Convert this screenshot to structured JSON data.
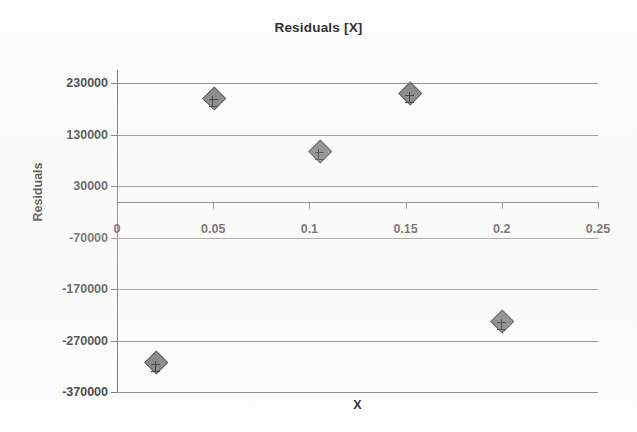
{
  "chart_data": {
    "type": "scatter",
    "title": "Residuals [X]",
    "xlabel": "X",
    "ylabel": "Residuals",
    "xlim": [
      0,
      0.25
    ],
    "ylim": [
      -370000,
      230000
    ],
    "grid": true,
    "legend": "none",
    "x_ticks": [
      "0",
      "0.05",
      "0.1",
      "0.15",
      "0.2",
      "0.25"
    ],
    "x_tick_values": [
      0,
      0.05,
      0.1,
      0.15,
      0.2,
      0.25
    ],
    "y_ticks": [
      "230000",
      "130000",
      "30000",
      "-70000",
      "-170000",
      "-270000",
      "-370000"
    ],
    "y_tick_values": [
      230000,
      130000,
      30000,
      -70000,
      -170000,
      -270000,
      -370000
    ],
    "marker_style": "diamond-with-error-bar",
    "marker_color": "#7d7d7d",
    "marker_edge_color": "#4c4c4c",
    "gridline_color": "#888888",
    "axis_color": "#6f6f6f",
    "series": [
      {
        "name": "Residuals",
        "points": [
          {
            "x": 0.02,
            "y": -311000
          },
          {
            "x": 0.05,
            "y": 203000
          },
          {
            "x": 0.105,
            "y": 100000
          },
          {
            "x": 0.152,
            "y": 212000
          },
          {
            "x": 0.2,
            "y": -230000
          }
        ]
      }
    ]
  }
}
